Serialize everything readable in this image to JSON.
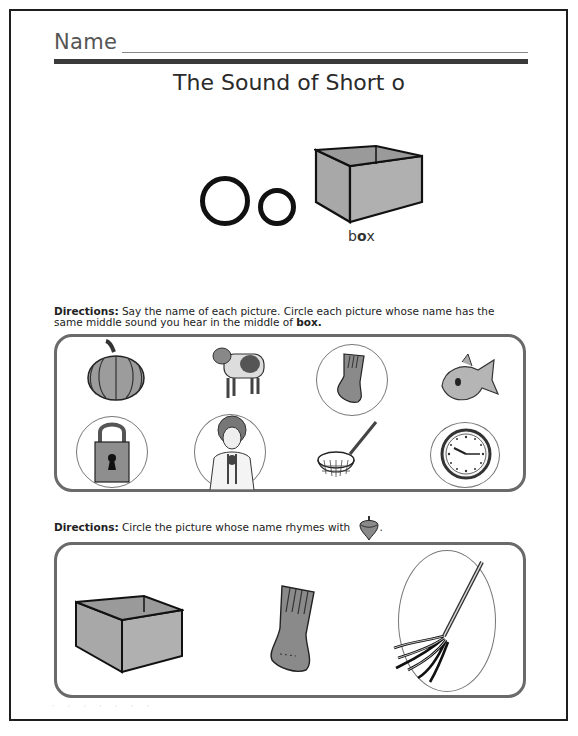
{
  "worksheet": {
    "name_label": "Name",
    "title": "The Sound of Short o",
    "featured_letters": {
      "uppercase": "O",
      "lowercase": "o"
    },
    "key_word": {
      "prefix": "b",
      "vowel": "o",
      "suffix": "x",
      "full": "box"
    }
  },
  "section1": {
    "directions_label": "Directions:",
    "directions_text": " Say the name of each picture. Circle each picture whose name has the same middle sound you hear in the middle of ",
    "directions_bold_word": "box.",
    "pictures": [
      {
        "name": "pumpkin",
        "circled": false
      },
      {
        "name": "cow",
        "circled": false
      },
      {
        "name": "sock",
        "circled": true
      },
      {
        "name": "fish",
        "circled": false
      },
      {
        "name": "lock",
        "circled": true
      },
      {
        "name": "doctor",
        "circled": true
      },
      {
        "name": "net",
        "circled": false
      },
      {
        "name": "clock",
        "circled": true
      }
    ]
  },
  "section2": {
    "directions_label": "Directions:",
    "directions_text": " Circle the picture whose name rhymes with ",
    "rhyme_picture": "top",
    "directions_end": ".",
    "pictures": [
      {
        "name": "box",
        "circled": false
      },
      {
        "name": "sock",
        "circled": false
      },
      {
        "name": "mop",
        "circled": true
      }
    ]
  },
  "colors": {
    "border": "#1e1e1e",
    "panel_border": "#6a6a6a",
    "fill_gray": "#a8a8a8",
    "circle_line": "#777777"
  }
}
